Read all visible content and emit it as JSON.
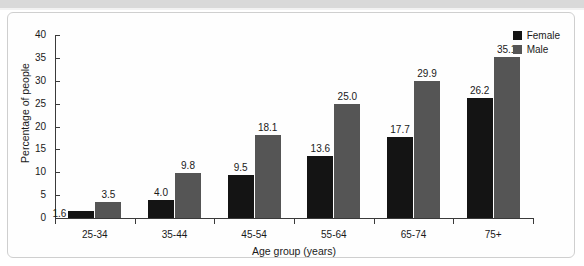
{
  "chart_data": {
    "type": "bar",
    "title": "",
    "subtitle": "",
    "xlabel": "Age group (years)",
    "ylabel": "Percentage of people",
    "categories": [
      "25-34",
      "35-44",
      "45-54",
      "55-64",
      "65-74",
      "75+"
    ],
    "series": [
      {
        "name": "Female",
        "color": "#141414",
        "values": [
          1.6,
          4.0,
          9.5,
          13.6,
          17.7,
          26.2
        ],
        "value_labels": [
          "1.6",
          "4.0",
          "9.5",
          "13.6",
          "17.7",
          "26.2"
        ]
      },
      {
        "name": "Male",
        "color": "#555555",
        "values": [
          3.5,
          9.8,
          18.1,
          25.0,
          29.9,
          35.1
        ],
        "value_labels": [
          "3.5",
          "9.8",
          "18.1",
          "25.0",
          "29.9",
          "35.1"
        ]
      }
    ],
    "ylim": [
      0,
      40
    ],
    "yticks": [
      0,
      5,
      10,
      15,
      20,
      25,
      30,
      35,
      40
    ],
    "ytick_labels": [
      "0",
      "5",
      "10",
      "15",
      "20",
      "25",
      "30",
      "35",
      "40"
    ],
    "grid": false,
    "legend_position": "top-right",
    "legend_entries": [
      "Female",
      "Male"
    ],
    "annotations": []
  },
  "legend": {
    "items": [
      {
        "label": "Female",
        "swatch": "female-swatch"
      },
      {
        "label": "Male",
        "swatch": "male-swatch"
      }
    ]
  }
}
